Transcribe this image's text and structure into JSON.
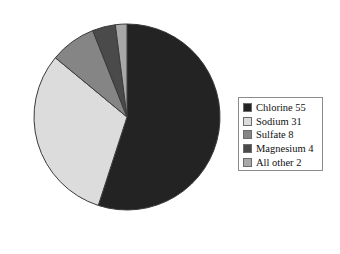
{
  "chart_data": {
    "type": "pie",
    "title": "",
    "subtitle": "",
    "xlabel": "",
    "ylabel": "",
    "grid": false,
    "legend_position": "right",
    "units": "percent",
    "start_angle_deg": 0,
    "direction": "clockwise",
    "categories": [
      "Chlorine",
      "Sodium",
      "Sulfate",
      "Magnesium",
      "All other"
    ],
    "values": [
      55,
      31,
      8,
      4,
      2
    ],
    "labels": [
      "Chlorine 55",
      "Sodium 31",
      "Sulfate 8",
      "Magnesium 4",
      "All other 2"
    ],
    "colors": [
      "#232323",
      "#dcdcdc",
      "#858585",
      "#4a4a4a",
      "#a8a8a8"
    ],
    "slices": [
      {
        "name": "Chlorine",
        "value": 55,
        "label": "Chlorine 55",
        "color": "#232323",
        "start_deg": 0,
        "end_deg": 198
      },
      {
        "name": "Sodium",
        "value": 31,
        "label": "Sodium 31",
        "color": "#dcdcdc",
        "start_deg": 198,
        "end_deg": 309.6
      },
      {
        "name": "Sulfate",
        "value": 8,
        "label": "Sulfate 8",
        "color": "#858585",
        "start_deg": 309.6,
        "end_deg": 338.4
      },
      {
        "name": "Magnesium",
        "value": 4,
        "label": "Magnesium 4",
        "color": "#4a4a4a",
        "start_deg": 338.4,
        "end_deg": 352.8
      },
      {
        "name": "All other",
        "value": 2,
        "label": "All other 2",
        "color": "#a8a8a8",
        "start_deg": 352.8,
        "end_deg": 360
      }
    ],
    "geometry": {
      "center_x": 127,
      "center_y": 117,
      "radius": 93
    },
    "style": {
      "slice_outline": "#3a3a3a",
      "legend_border": "#8c8c8c",
      "background": "#ffffff"
    }
  },
  "legend": {
    "items": [
      {
        "label": "Chlorine 55",
        "color": "#232323",
        "swatch_name": "legend-swatch-chlorine"
      },
      {
        "label": "Sodium 31",
        "color": "#dcdcdc",
        "swatch_name": "legend-swatch-sodium"
      },
      {
        "label": "Sulfate 8",
        "color": "#858585",
        "swatch_name": "legend-swatch-sulfate"
      },
      {
        "label": "Magnesium 4",
        "color": "#4a4a4a",
        "swatch_name": "legend-swatch-magnesium"
      },
      {
        "label": "All other 2",
        "color": "#a8a8a8",
        "swatch_name": "legend-swatch-all-other"
      }
    ]
  }
}
